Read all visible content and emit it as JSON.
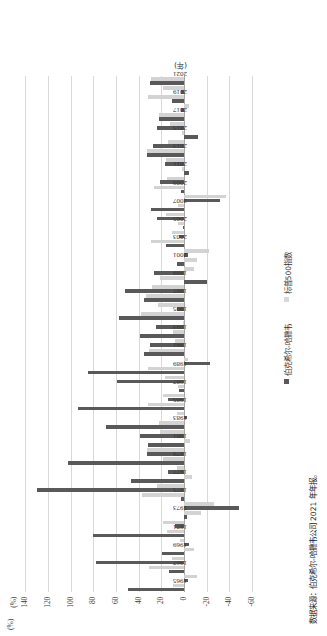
{
  "chart_data": {
    "type": "bar",
    "title": "",
    "subtitle": "",
    "xlabel": "(年)",
    "ylabel": "(%)",
    "ylim": [
      -60,
      150
    ],
    "grid": true,
    "legend_position": "bottom",
    "ytick_labels": [
      "(%)",
      "140",
      "120",
      "100",
      "80",
      "60",
      "40",
      "20",
      "0",
      "-20",
      "-40",
      "-60"
    ],
    "ytick_values": [
      150,
      140,
      120,
      100,
      80,
      60,
      40,
      20,
      0,
      -20,
      -40,
      -60
    ],
    "categories": [
      "1965",
      "1966",
      "1967",
      "1968",
      "1969",
      "1970",
      "1971",
      "1972",
      "1973",
      "1974",
      "1975",
      "1976",
      "1977",
      "1978",
      "1979",
      "1980",
      "1981",
      "1982",
      "1983",
      "1984",
      "1985",
      "1986",
      "1987",
      "1988",
      "1989",
      "1990",
      "1991",
      "1992",
      "1993",
      "1994",
      "1995",
      "1996",
      "1997",
      "1998",
      "1999",
      "2000",
      "2001",
      "2002",
      "2003",
      "2004",
      "2005",
      "2006",
      "2007",
      "2008",
      "2009",
      "2010",
      "2011",
      "2012",
      "2013",
      "2014",
      "2015",
      "2016",
      "2017",
      "2018",
      "2019",
      "2020",
      "2021"
    ],
    "xtick_labels": [
      "1965",
      "1967",
      "1969",
      "1971",
      "1973",
      "1975",
      "1977",
      "1979",
      "1981",
      "1983",
      "1985",
      "1987",
      "1989",
      "1991",
      "1993",
      "1995",
      "1997",
      "1999",
      "2001",
      "2003",
      "2005",
      "2007",
      "2009",
      "2011",
      "2013",
      "2015",
      "2017",
      "2019",
      "2021"
    ],
    "series": [
      {
        "name": "伯克希尔-哈撒韦",
        "color": "#595959",
        "values": [
          49.5,
          -3.4,
          13.3,
          77.8,
          19.4,
          -4.6,
          80.5,
          8.1,
          -2.5,
          -48.7,
          2.5,
          129.3,
          46.8,
          14.5,
          102.5,
          32.8,
          31.8,
          38.4,
          69.0,
          -2.7,
          93.7,
          14.2,
          4.6,
          59.3,
          84.6,
          -23.1,
          35.6,
          29.8,
          38.9,
          25.0,
          57.4,
          6.2,
          34.9,
          52.2,
          -19.9,
          26.6,
          6.5,
          -3.8,
          15.8,
          4.3,
          0.8,
          24.1,
          28.7,
          -31.8,
          2.7,
          21.4,
          -4.7,
          16.8,
          32.7,
          27.0,
          -12.5,
          23.4,
          21.9,
          2.8,
          11.0,
          2.4,
          29.6
        ]
      },
      {
        "name": "标普500指数",
        "color": "#d9d9d9",
        "values": [
          10.0,
          -11.7,
          30.9,
          11.0,
          -8.4,
          3.9,
          14.6,
          18.9,
          -14.8,
          -26.4,
          37.2,
          23.6,
          -7.4,
          6.4,
          18.2,
          32.3,
          -5.0,
          21.4,
          22.4,
          6.1,
          31.6,
          18.6,
          5.1,
          16.6,
          31.7,
          -3.1,
          30.5,
          7.6,
          10.1,
          1.3,
          37.6,
          23.0,
          33.4,
          28.6,
          21.0,
          -9.1,
          -11.9,
          -22.1,
          28.7,
          10.9,
          4.9,
          15.8,
          5.5,
          -37.0,
          26.5,
          15.1,
          2.1,
          16.0,
          32.4,
          13.7,
          1.4,
          12.0,
          21.8,
          -4.4,
          31.5,
          18.4,
          28.7
        ]
      }
    ]
  },
  "legend": {
    "items": [
      {
        "label": "伯克希尔-哈撒韦",
        "swatch": "berk"
      },
      {
        "label": "标普500指数",
        "swatch": "sp"
      }
    ]
  },
  "source": {
    "text": "数据来源：伯克希尔-哈撒韦公司 2021 年年报。"
  },
  "axis": {
    "y_title": "(%)",
    "x_title": "(年)"
  }
}
